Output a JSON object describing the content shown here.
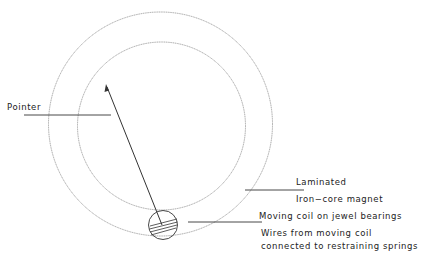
{
  "diagram": {
    "type": "moving-coil meter schematic",
    "labels": {
      "pointer": "Pointer",
      "magnet_line1": "Laminated",
      "magnet_line2": "Iron−core magnet",
      "coil": "Moving coil on jewel bearings",
      "wires_line1": "Wires from moving coil",
      "wires_line2": "connected to restraining springs"
    },
    "colors": {
      "circle_stroke": "#9a9a9a",
      "line_stroke": "#333333",
      "text": "#222222"
    }
  }
}
